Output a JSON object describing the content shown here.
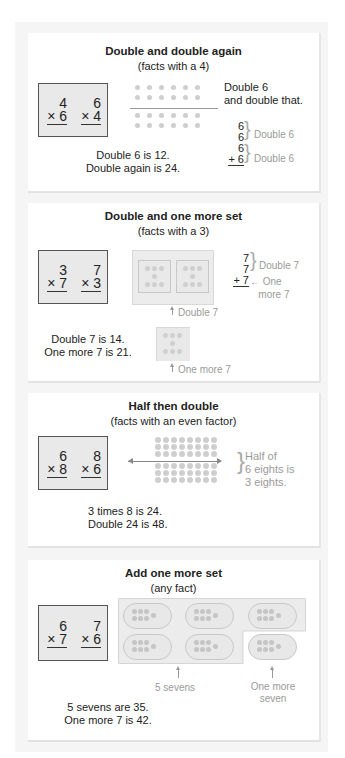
{
  "cards": [
    {
      "title": "Double and double again",
      "subtitle": "(facts with a 4)",
      "facts": [
        {
          "top": "4",
          "bottom": "× 6"
        },
        {
          "top": "6",
          "bottom": "× 4"
        }
      ],
      "note": [
        "Double 6",
        "and double that."
      ],
      "stack": [
        "6",
        "6",
        "6",
        "+ 6"
      ],
      "stack_labels": [
        "Double 6",
        "Double 6"
      ],
      "summary": [
        "Double 6 is 12.",
        "Double again is 24."
      ],
      "array": {
        "rows": 4,
        "cols": 6,
        "split_after_row": 2
      }
    },
    {
      "title": "Double and one more set",
      "subtitle": "(facts with a 3)",
      "facts": [
        {
          "top": "3",
          "bottom": "× 7"
        },
        {
          "top": "7",
          "bottom": "× 3"
        }
      ],
      "stack": [
        "7",
        "7",
        "+ 7"
      ],
      "stack_labels": [
        "Double 7",
        "One",
        "more 7"
      ],
      "arrow_labels": [
        "Double 7",
        "One more 7"
      ],
      "summary": [
        "Double 7 is 14.",
        "One more 7 is 21."
      ],
      "dice_dots_each": 7
    },
    {
      "title": "Half then double",
      "subtitle": "(facts with an even factor)",
      "facts": [
        {
          "top": "6",
          "bottom": "× 8"
        },
        {
          "top": "8",
          "bottom": "× 6"
        }
      ],
      "note": [
        "Half of",
        "6 eights is",
        "3 eights."
      ],
      "summary": [
        "3 times 8 is 24.",
        "Double 24 is 48."
      ],
      "array": {
        "rows": 6,
        "cols": 8,
        "split_after_row": 3
      }
    },
    {
      "title": "Add one more set",
      "subtitle": "(any fact)",
      "facts": [
        {
          "top": "6",
          "bottom": "× 7"
        },
        {
          "top": "7",
          "bottom": "× 6"
        }
      ],
      "arrow_labels": [
        "5 sevens",
        "One more",
        "seven"
      ],
      "summary": [
        "5 sevens are 35.",
        "One more 7 is 42."
      ],
      "groups": 6,
      "dots_per_group": 7
    }
  ],
  "colors": {
    "panel": "#f5f5f5",
    "card": "#ffffff",
    "factbox": "#e9e9e9",
    "dot": "#cfcfcf",
    "label_gray": "#9a9a9a"
  }
}
